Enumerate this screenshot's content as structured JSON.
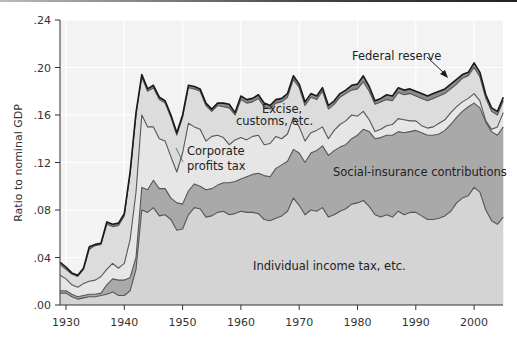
{
  "chart_data": {
    "type": "area",
    "stacked": true,
    "title": "",
    "xlabel": "",
    "ylabel": "Ratio to nominal GDP",
    "ylim": [
      0,
      0.24
    ],
    "xlim": [
      1929,
      2005
    ],
    "y_ticks": [
      ".00",
      ".04",
      ".08",
      ".12",
      ".16",
      ".20",
      ".24"
    ],
    "y_tick_values": [
      0,
      0.04,
      0.08,
      0.12,
      0.16,
      0.2,
      0.24
    ],
    "x_ticks": [
      "1930",
      "1940",
      "1950",
      "1960",
      "1970",
      "1980",
      "1990",
      "2000"
    ],
    "x_tick_values": [
      1930,
      1940,
      1950,
      1960,
      1970,
      1980,
      1990,
      2000
    ],
    "grid": true,
    "legend": "inline annotations",
    "x": [
      1929,
      1930,
      1931,
      1932,
      1933,
      1934,
      1935,
      1936,
      1937,
      1938,
      1939,
      1940,
      1941,
      1942,
      1943,
      1944,
      1945,
      1946,
      1947,
      1948,
      1949,
      1950,
      1951,
      1952,
      1953,
      1954,
      1955,
      1956,
      1957,
      1958,
      1959,
      1960,
      1961,
      1962,
      1963,
      1964,
      1965,
      1966,
      1967,
      1968,
      1969,
      1970,
      1971,
      1972,
      1973,
      1974,
      1975,
      1976,
      1977,
      1978,
      1979,
      1980,
      1981,
      1982,
      1983,
      1984,
      1985,
      1986,
      1987,
      1988,
      1989,
      1990,
      1991,
      1992,
      1993,
      1994,
      1995,
      1996,
      1997,
      1998,
      1999,
      2000,
      2001,
      2002,
      2003,
      2004,
      2005
    ],
    "cumulative_tops": {
      "individual_income_tax": [
        0.01,
        0.01,
        0.007,
        0.005,
        0.006,
        0.007,
        0.007,
        0.008,
        0.009,
        0.011,
        0.008,
        0.008,
        0.012,
        0.03,
        0.08,
        0.078,
        0.082,
        0.075,
        0.076,
        0.072,
        0.063,
        0.064,
        0.076,
        0.082,
        0.081,
        0.074,
        0.075,
        0.078,
        0.079,
        0.076,
        0.077,
        0.079,
        0.078,
        0.078,
        0.077,
        0.072,
        0.071,
        0.073,
        0.075,
        0.079,
        0.09,
        0.084,
        0.076,
        0.08,
        0.079,
        0.082,
        0.074,
        0.076,
        0.079,
        0.081,
        0.085,
        0.086,
        0.088,
        0.083,
        0.076,
        0.074,
        0.076,
        0.074,
        0.079,
        0.076,
        0.078,
        0.078,
        0.075,
        0.072,
        0.072,
        0.073,
        0.075,
        0.079,
        0.086,
        0.09,
        0.092,
        0.099,
        0.095,
        0.08,
        0.071,
        0.068,
        0.074
      ],
      "social_insurance": [
        0.012,
        0.012,
        0.009,
        0.007,
        0.008,
        0.009,
        0.009,
        0.01,
        0.017,
        0.022,
        0.021,
        0.021,
        0.023,
        0.04,
        0.099,
        0.097,
        0.105,
        0.098,
        0.098,
        0.09,
        0.086,
        0.085,
        0.096,
        0.102,
        0.1,
        0.097,
        0.098,
        0.101,
        0.103,
        0.103,
        0.104,
        0.106,
        0.108,
        0.11,
        0.111,
        0.109,
        0.108,
        0.115,
        0.118,
        0.121,
        0.131,
        0.128,
        0.12,
        0.128,
        0.13,
        0.134,
        0.126,
        0.13,
        0.133,
        0.135,
        0.14,
        0.143,
        0.148,
        0.146,
        0.14,
        0.141,
        0.143,
        0.143,
        0.146,
        0.145,
        0.146,
        0.147,
        0.145,
        0.143,
        0.143,
        0.144,
        0.147,
        0.152,
        0.158,
        0.163,
        0.167,
        0.17,
        0.166,
        0.154,
        0.146,
        0.143,
        0.15
      ],
      "corporate_profits_tax": [
        0.025,
        0.022,
        0.017,
        0.015,
        0.018,
        0.02,
        0.021,
        0.024,
        0.03,
        0.035,
        0.031,
        0.035,
        0.055,
        0.095,
        0.16,
        0.15,
        0.15,
        0.14,
        0.138,
        0.125,
        0.112,
        0.128,
        0.153,
        0.15,
        0.148,
        0.138,
        0.142,
        0.143,
        0.141,
        0.135,
        0.139,
        0.141,
        0.139,
        0.142,
        0.143,
        0.135,
        0.136,
        0.142,
        0.14,
        0.144,
        0.158,
        0.15,
        0.138,
        0.145,
        0.147,
        0.15,
        0.14,
        0.147,
        0.152,
        0.155,
        0.16,
        0.159,
        0.163,
        0.156,
        0.146,
        0.148,
        0.151,
        0.152,
        0.157,
        0.156,
        0.155,
        0.155,
        0.151,
        0.149,
        0.15,
        0.153,
        0.156,
        0.162,
        0.167,
        0.171,
        0.174,
        0.178,
        0.172,
        0.155,
        0.148,
        0.15,
        0.162
      ],
      "excise_customs": [
        0.034,
        0.03,
        0.026,
        0.024,
        0.03,
        0.047,
        0.05,
        0.051,
        0.068,
        0.066,
        0.067,
        0.075,
        0.11,
        0.16,
        0.192,
        0.18,
        0.183,
        0.173,
        0.17,
        0.158,
        0.143,
        0.158,
        0.183,
        0.182,
        0.18,
        0.168,
        0.163,
        0.168,
        0.167,
        0.166,
        0.16,
        0.173,
        0.17,
        0.171,
        0.174,
        0.167,
        0.165,
        0.17,
        0.171,
        0.175,
        0.19,
        0.183,
        0.168,
        0.175,
        0.173,
        0.18,
        0.165,
        0.169,
        0.175,
        0.178,
        0.181,
        0.182,
        0.188,
        0.18,
        0.169,
        0.171,
        0.173,
        0.172,
        0.179,
        0.177,
        0.178,
        0.176,
        0.174,
        0.172,
        0.174,
        0.176,
        0.178,
        0.182,
        0.186,
        0.191,
        0.193,
        0.2,
        0.192,
        0.174,
        0.163,
        0.16,
        0.172
      ],
      "federal_reserve": [
        0.036,
        0.032,
        0.027,
        0.025,
        0.031,
        0.049,
        0.051,
        0.052,
        0.07,
        0.068,
        0.069,
        0.077,
        0.112,
        0.162,
        0.194,
        0.182,
        0.185,
        0.175,
        0.172,
        0.16,
        0.145,
        0.16,
        0.185,
        0.184,
        0.182,
        0.17,
        0.165,
        0.17,
        0.17,
        0.169,
        0.162,
        0.176,
        0.173,
        0.174,
        0.177,
        0.17,
        0.168,
        0.173,
        0.174,
        0.178,
        0.193,
        0.186,
        0.171,
        0.178,
        0.176,
        0.183,
        0.168,
        0.172,
        0.178,
        0.181,
        0.185,
        0.186,
        0.193,
        0.184,
        0.172,
        0.174,
        0.177,
        0.176,
        0.183,
        0.181,
        0.182,
        0.18,
        0.178,
        0.176,
        0.178,
        0.18,
        0.182,
        0.186,
        0.19,
        0.194,
        0.196,
        0.204,
        0.196,
        0.177,
        0.166,
        0.163,
        0.175
      ]
    },
    "series": [
      {
        "name": "Individual income tax, etc.",
        "key": "individual_income_tax",
        "color": "#d4d4d4"
      },
      {
        "name": "Social-insurance contributions",
        "key": "social_insurance",
        "color": "#a9a9a9"
      },
      {
        "name": "Corporate profits tax",
        "key": "corporate_profits_tax",
        "color": "#e6e6e6"
      },
      {
        "name": "Excise, customs, etc.",
        "key": "excise_customs",
        "color": "#dcdcdc"
      },
      {
        "name": "Federal reserve",
        "key": "federal_reserve",
        "color": "#8a8a8a"
      }
    ],
    "annotations": [
      {
        "text": "Federal reserve",
        "x": 352,
        "y": 60,
        "arrow": true
      },
      {
        "text": "Excise,",
        "x": 262,
        "y": 113
      },
      {
        "text": "customs, etc.",
        "x": 236,
        "y": 125
      },
      {
        "text": "Corporate",
        "x": 187,
        "y": 155
      },
      {
        "text": "profits tax",
        "x": 187,
        "y": 170
      },
      {
        "text": "Social-insurance contributions",
        "x": 333,
        "y": 176
      },
      {
        "text": "Individual income tax, etc.",
        "x": 253,
        "y": 270
      }
    ]
  },
  "colors": {
    "background": "#ffffff",
    "plot_background": "#f3f3f3",
    "line_dark": "#1a1a1a",
    "line_mid": "#555555",
    "gridline": "#ffffff"
  }
}
